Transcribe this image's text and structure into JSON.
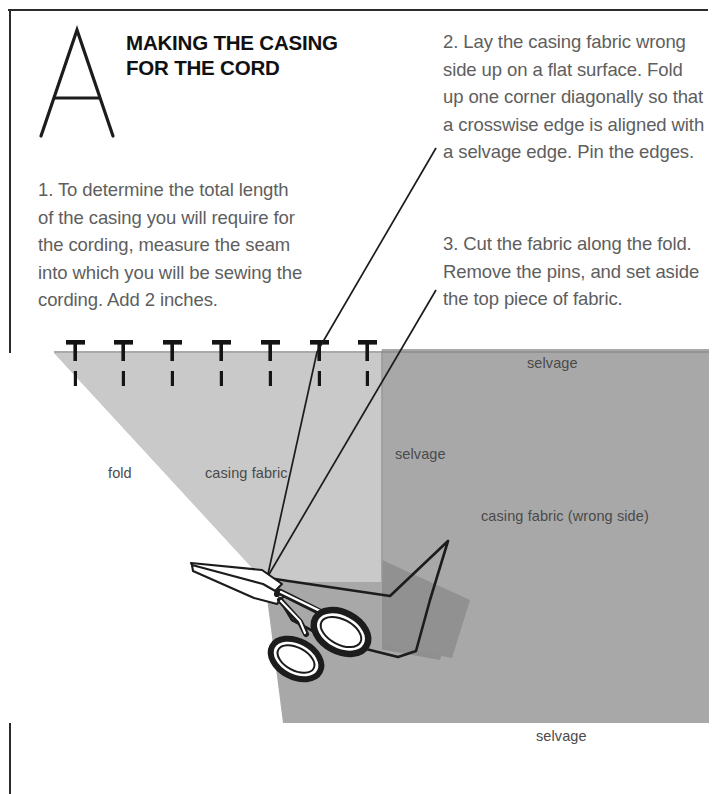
{
  "header": {
    "logo_letter": "A",
    "title_line_1": "MAKING THE CASING",
    "title_line_2": "FOR THE CORD"
  },
  "steps": [
    {
      "id": "step-1",
      "text": "1. To determine the total length of the casing you will require for the cording, measure the seam into which you will be sewing the cording. Add 2 inches."
    },
    {
      "id": "step-2",
      "text": "2. Lay the casing fabric wrong side up on a flat surface. Fold up one corner diagonally so that a crosswise edge is aligned with a selvage edge. Pin the edges."
    },
    {
      "id": "step-3",
      "text": "3. Cut the fabric along the fold. Remove the pins, and set aside the top piece of fabric."
    }
  ],
  "diagram": {
    "labels": {
      "fold": "fold",
      "casing_fabric": "casing fabric",
      "selvage_top": "selvage",
      "selvage_left": "selvage",
      "casing_fabric_wrong_side": "casing fabric (wrong side)",
      "selvage_bottom": "selvage"
    },
    "pin_count": 7,
    "colors": {
      "fabric_wrong_side": "#a8a8a8",
      "fabric_folded_flap": "#c9c9c9",
      "fabric_shadow": "#8f8f8f",
      "outline": "#1c1c1c",
      "label_text": "#4a4a4a",
      "body_text": "#5e5e5e",
      "heading_text": "#111111",
      "page_background": "#ffffff"
    }
  }
}
